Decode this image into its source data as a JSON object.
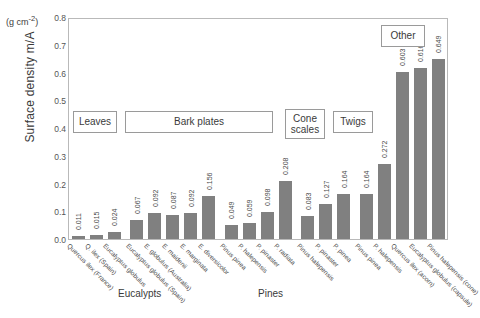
{
  "chart_data": {
    "type": "bar",
    "title": "",
    "xlabel": "",
    "ylabel": "Surface density m/A",
    "yunit": "(g cm-2)",
    "ylim": [
      0.0,
      0.8
    ],
    "ytick_labels": [
      "0.8",
      "0.7",
      "0.6",
      "0.5",
      "0.4",
      "0.3",
      "0.2",
      "0.1",
      "0.0"
    ],
    "ytick_values": [
      0.8,
      0.7,
      0.6,
      0.5,
      0.4,
      0.3,
      0.2,
      0.1,
      0.0
    ],
    "grid": false,
    "legend": "none",
    "bar_color": "#808080",
    "categories": [
      "Quercus ilex (France)",
      "Q. ilex (Spain)",
      "Eucalyptus globulus",
      "Eucalyptus globulus (Spain)",
      "E. globulus (Australia)",
      "E. maidenii",
      "E. marginata",
      "E. diversicolor",
      "Pinus pinea",
      "P. halepensis",
      "P. pinaster",
      "P. radiata",
      "Pinus halepensis",
      "P. pinaster",
      "P. pinea",
      "Pinus pinea",
      "P. halepensis",
      "Quercus ilex (acorn)",
      "Eucalyptus globulus (capsule)",
      "Pinus halepensis (cone)"
    ],
    "values": [
      0.011,
      0.015,
      0.024,
      0.067,
      0.092,
      0.087,
      0.092,
      0.156,
      0.049,
      0.059,
      0.098,
      0.208,
      0.083,
      0.127,
      0.164,
      0.164,
      0.272,
      0.603,
      0.616,
      0.649
    ],
    "value_labels": [
      "0.011",
      "0.015",
      "0.024",
      "0.067",
      "0.092",
      "0.087",
      "0.092",
      "0.156",
      "0.049",
      "0.059",
      "0.098",
      "0.208",
      "0.083",
      "0.127",
      "0.164",
      "0.164",
      "0.272",
      "0.603",
      "0.616",
      "0.649"
    ],
    "part_groups": [
      {
        "label": "Leaves",
        "count": 3
      },
      {
        "label": "Bark plates",
        "count": 5
      },
      {
        "label": "Cone scales",
        "count": 4
      },
      {
        "label": "Twigs",
        "count": 3
      },
      {
        "label": "Other",
        "count": 5
      }
    ],
    "taxon_groups": [
      {
        "label": "Eucalypts"
      },
      {
        "label": "Pines"
      }
    ]
  },
  "boxes": {
    "leaves": "Leaves",
    "bark": "Bark plates",
    "cone": "Cone scales",
    "twigs": "Twigs",
    "other": "Other"
  },
  "group_titles": {
    "eucalypts": "Eucalypts",
    "pines": "Pines"
  }
}
